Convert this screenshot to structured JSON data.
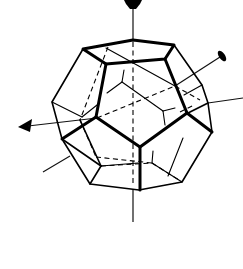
{
  "figure": {
    "title": "",
    "colors": {
      "line": "#000000",
      "background": "#ffffff"
    },
    "axes": [
      {
        "name": "vertical-axis",
        "from": [
          133,
          8
        ],
        "to": [
          133,
          222
        ],
        "head": "pentagon-top"
      },
      {
        "name": "diagonal-axis",
        "from": [
          18,
          127
        ],
        "to": [
          225,
          50
        ],
        "head": "arrow-left-and-ellipse-right"
      },
      {
        "name": "right-axis",
        "from": [
          208,
          103
        ],
        "to": [
          243,
          98
        ],
        "head": "none"
      },
      {
        "name": "left-axis",
        "from": [
          43,
          172
        ],
        "to": [
          70,
          155
        ],
        "head": "none"
      }
    ]
  }
}
